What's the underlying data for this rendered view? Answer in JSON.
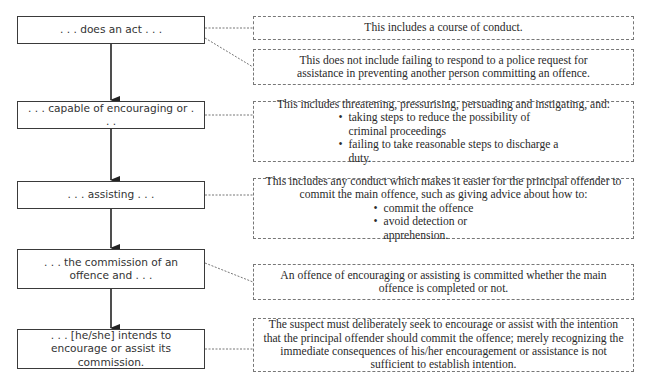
{
  "diagram": {
    "type": "flowchart",
    "colors": {
      "box_border": "#3a3a3a",
      "note_border": "#777777",
      "arrow": "#222222",
      "text": "#333333"
    },
    "stages": [
      {
        "label": ". . . does an act . . ."
      },
      {
        "label": ". . . capable of encouraging or . . ."
      },
      {
        "label": ". . . assisting . . ."
      },
      {
        "label": ". . . the commission of an offence and . . ."
      },
      {
        "label": ". . . [he/she] intends to encourage or assist its commission."
      }
    ],
    "notes": [
      {
        "stage": 0,
        "text": "This includes a course of conduct."
      },
      {
        "stage": 0,
        "text": "This does not include failing to respond to a police request for assistance in preventing another person committing an offence."
      },
      {
        "stage": 1,
        "text": "This includes threatening, pressurising, persuading and instigating, and:",
        "bullets": [
          "taking steps to reduce the possibility of criminal proceedings",
          "failing to take reasonable steps to discharge a duty."
        ]
      },
      {
        "stage": 2,
        "text": "This includes any conduct which makes it easier for the principal offender to commit the main offence, such as giving advice about how to:",
        "bullets": [
          "commit the offence",
          "avoid detection or apprehension."
        ]
      },
      {
        "stage": 3,
        "text": "An offence of encouraging or assisting is committed whether the main offence is completed or not."
      },
      {
        "stage": 4,
        "text": "The suspect must deliberately seek to encourage or assist with the intention that the principal offender should commit the offence; merely recognizing the immediate consequences of his/her encouragement or assistance is not sufficient to establish intention."
      }
    ]
  }
}
